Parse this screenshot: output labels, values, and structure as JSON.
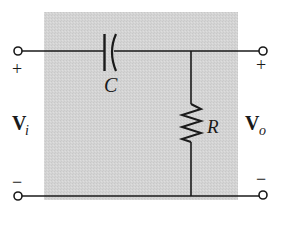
{
  "diagram": {
    "type": "RC high-pass filter circuit",
    "colors": {
      "background": "#ffffff",
      "shaded_region": "#d3d3d3",
      "wire": "#1a1a1a"
    },
    "components": {
      "capacitor": {
        "label": "C"
      },
      "resistor": {
        "label": "R"
      }
    },
    "input": {
      "label_main": "V",
      "label_sub": "i",
      "plus": "+",
      "minus": "−"
    },
    "output": {
      "label_main": "V",
      "label_sub": "o",
      "plus": "+",
      "minus": "−"
    }
  }
}
